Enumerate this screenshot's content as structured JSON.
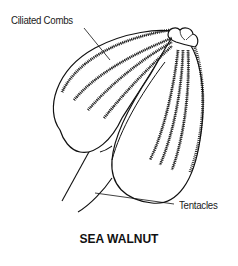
{
  "diagram": {
    "title": "SEA WALNUT",
    "labels": {
      "ciliated_combs": "Ciliated Combs",
      "tentacles": "Tentacles"
    },
    "stroke_color": "#111111",
    "background": "#ffffff"
  }
}
